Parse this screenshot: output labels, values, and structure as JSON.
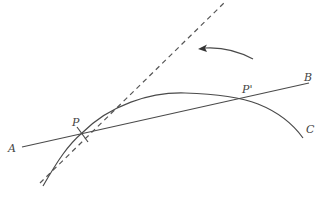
{
  "diagram": {
    "labels": {
      "A": "A",
      "B": "B",
      "C": "C",
      "P": "P",
      "P_prime": "P'"
    },
    "colors": {
      "stroke": "#4a4a4a",
      "dashed": "#555555",
      "text": "#444444",
      "background": "#ffffff"
    },
    "elements": [
      {
        "name": "curve",
        "type": "curve",
        "label": "C",
        "description": "Concave-down curve passing through P and P'"
      },
      {
        "name": "secant-line",
        "type": "line",
        "from": "A",
        "to": "B",
        "description": "Secant line through P and P'"
      },
      {
        "name": "tangent-line",
        "type": "dashed-line",
        "description": "Tangent line to the curve at P"
      },
      {
        "name": "rotation-arrow",
        "type": "arrow",
        "description": "Curved arrow indicating secant rotating counterclockwise toward tangent"
      },
      {
        "name": "tick-mark",
        "type": "mark",
        "at": "P",
        "description": "Short tick mark at point P"
      }
    ]
  }
}
